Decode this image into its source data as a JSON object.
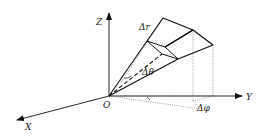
{
  "figure": {
    "type": "spherical volume element diagram",
    "axes": {
      "x_label": "X",
      "y_label": "Y",
      "z_label": "Z",
      "origin_label": "O"
    },
    "annotations": {
      "delta_r": "Δr",
      "delta_theta": "Δθ",
      "delta_phi": "Δφ"
    },
    "colors": {
      "line": "#111111",
      "dotted": "#888888",
      "background": "#ffffff"
    }
  }
}
